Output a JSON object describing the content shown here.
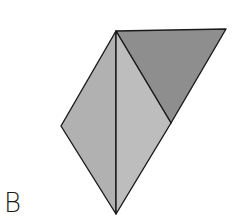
{
  "figure": {
    "label": "B",
    "shapes": [
      {
        "name": "top-right-triangle",
        "points": "116,31 226,29 171,123",
        "fill": "#8e8e8e"
      },
      {
        "name": "left-triangle",
        "points": "116,31 61,126 116,214",
        "fill": "#b1b1b1"
      },
      {
        "name": "middle-triangle",
        "points": "116,31 171,123 116,214",
        "fill": "#bdbdbd"
      }
    ],
    "stroke": "#1a1a1a"
  }
}
